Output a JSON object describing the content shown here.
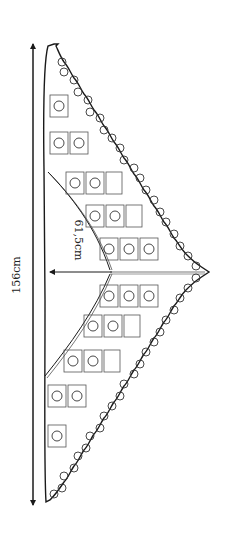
{
  "diagram": {
    "labels": {
      "width": "156cm",
      "depth": "61,5cm"
    },
    "colors": {
      "ink": "#1a1a1a",
      "background": "#ffffff"
    }
  }
}
